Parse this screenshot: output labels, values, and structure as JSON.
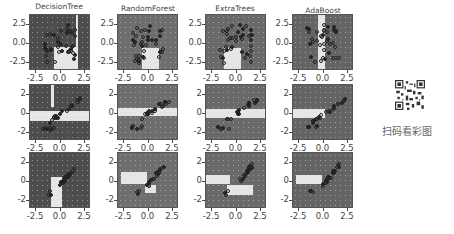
{
  "figure": {
    "columns": [
      "DecisionTree",
      "RandomForest",
      "ExtraTrees",
      "AdaBoost"
    ],
    "rows": 3,
    "row_yticks": [
      [
        "2.5",
        "0.0",
        "-2.5"
      ],
      [
        "2",
        "0",
        "-2"
      ],
      [
        "2",
        "0",
        "-2"
      ]
    ],
    "xticks": [
      "-2.5",
      "0.0",
      "2.5"
    ]
  },
  "qr": {
    "label": "扫码看彩图"
  },
  "caption": "图",
  "chart_data": {
    "type": "scatter",
    "layout": {
      "rows": 3,
      "cols": 4,
      "grid": false,
      "legend": "none"
    },
    "column_titles": [
      "DecisionTree",
      "RandomForest",
      "ExtraTrees",
      "AdaBoost"
    ],
    "panels": [
      {
        "row": 1,
        "xlim": [
          -3.5,
          3.5
        ],
        "ylim": [
          -3.5,
          4
        ],
        "xticks": [
          -2.5,
          0.0,
          2.5
        ],
        "yticks": [
          -2.5,
          0.0,
          2.5
        ],
        "dataset": "two overlapping clusters"
      },
      {
        "row": 2,
        "xlim": [
          -3.5,
          3.5
        ],
        "ylim": [
          -2.5,
          2.5
        ],
        "xticks": [
          -2.5,
          0.0,
          2.5
        ],
        "yticks": [
          -2,
          0,
          2
        ],
        "dataset": "linearly elongated cluster plus compact cluster"
      },
      {
        "row": 3,
        "xlim": [
          -3.5,
          3.5
        ],
        "ylim": [
          -2.5,
          2.5
        ],
        "xticks": [
          -2.5,
          0.0,
          2.5
        ],
        "yticks": [
          -2,
          0,
          2
        ],
        "dataset": "three small clusters"
      }
    ],
    "xlabel": "",
    "ylabel": ""
  }
}
